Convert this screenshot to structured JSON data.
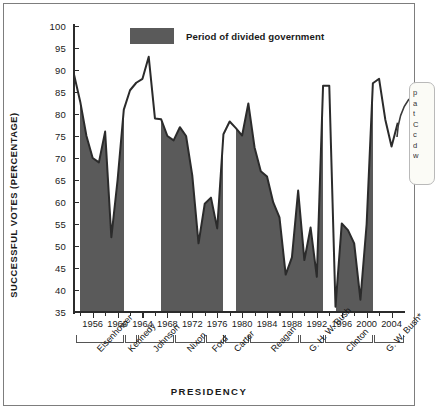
{
  "chart_data": {
    "type": "area",
    "title": "",
    "xlabel": "PRESIDENCY",
    "ylabel": "SUCCESSFUL VOTES (PERCENTAGE)",
    "ylim": [
      35,
      100
    ],
    "ytick_step": 5,
    "yticks": [
      35,
      40,
      45,
      50,
      55,
      60,
      65,
      70,
      75,
      80,
      85,
      90,
      95,
      100
    ],
    "xlim": [
      1953,
      2006
    ],
    "xticks": [
      1954,
      1956,
      1958,
      1960,
      1962,
      1964,
      1966,
      1968,
      1970,
      1972,
      1974,
      1976,
      1978,
      1980,
      1982,
      1984,
      1986,
      1988,
      1990,
      1992,
      1994,
      1996,
      1998,
      2000,
      2002,
      2004
    ],
    "xtick_labels": [
      {
        "year": 1956,
        "label": "1956"
      },
      {
        "year": 1960,
        "label": "1960"
      },
      {
        "year": 1964,
        "label": "1964"
      },
      {
        "year": 1968,
        "label": "1968"
      },
      {
        "year": 1972,
        "label": "1972"
      },
      {
        "year": 1976,
        "label": "1976"
      },
      {
        "year": 1980,
        "label": "1980"
      },
      {
        "year": 1984,
        "label": "1984"
      },
      {
        "year": 1988,
        "label": "1988"
      },
      {
        "year": 1992,
        "label": "1992"
      },
      {
        "year": 1996,
        "label": "1996"
      },
      {
        "year": 2000,
        "label": "2000"
      },
      {
        "year": 2004,
        "label": "2004"
      }
    ],
    "grid": false,
    "legend": {
      "position": "top-center",
      "entries": [
        {
          "label": "Period of divided government",
          "color": "#5a5a5a"
        }
      ]
    },
    "series": [
      {
        "name": "Successful votes (percentage)",
        "color": "#2b2b2b",
        "x": [
          1953,
          1954,
          1955,
          1956,
          1957,
          1958,
          1959,
          1960,
          1961,
          1962,
          1963,
          1964,
          1965,
          1966,
          1967,
          1968,
          1969,
          1970,
          1971,
          1972,
          1973,
          1974,
          1975,
          1976,
          1977,
          1978,
          1979,
          1980,
          1981,
          1982,
          1983,
          1984,
          1985,
          1986,
          1987,
          1988,
          1989,
          1990,
          1991,
          1992,
          1993,
          1994,
          1995,
          1996,
          1997,
          1998,
          1999,
          2000,
          2001,
          2002,
          2003,
          2004,
          2005
        ],
        "values": [
          89.0,
          82.8,
          75.0,
          70.0,
          69.0,
          76.0,
          52.0,
          65.0,
          81.0,
          85.4,
          87.1,
          88.0,
          93.0,
          79.0,
          78.8,
          75.0,
          74.0,
          77.0,
          75.0,
          66.0,
          50.6,
          59.6,
          61.0,
          54.0,
          75.4,
          78.3,
          76.8,
          75.1,
          82.4,
          72.4,
          67.0,
          65.8,
          59.9,
          56.5,
          43.5,
          47.4,
          62.6,
          46.8,
          54.2,
          43.0,
          86.4,
          86.4,
          36.2,
          55.1,
          53.6,
          50.6,
          37.8,
          55.0,
          87.0,
          88.0,
          78.7,
          72.6,
          78.0
        ]
      }
    ],
    "shaded_bands": [
      {
        "start": 1954,
        "end": 1961,
        "label": "divided government"
      },
      {
        "start": 1967,
        "end": 1977,
        "label": "divided government"
      },
      {
        "start": 1979,
        "end": 1993,
        "label": "divided government"
      },
      {
        "start": 1995,
        "end": 2001,
        "label": "divided government"
      }
    ],
    "presidencies": [
      {
        "name": "Eisenhower",
        "start": 1953,
        "end": 1961
      },
      {
        "name": "Kennedy",
        "start": 1961,
        "end": 1963
      },
      {
        "name": "Johnson",
        "start": 1963,
        "end": 1969
      },
      {
        "name": "Nixon",
        "start": 1969,
        "end": 1974
      },
      {
        "name": "Ford",
        "start": 1974,
        "end": 1977
      },
      {
        "name": "Carter",
        "start": 1977,
        "end": 1981
      },
      {
        "name": "Reagan",
        "start": 1981,
        "end": 1989
      },
      {
        "name": "G. H. W. Bush",
        "start": 1989,
        "end": 1993
      },
      {
        "name": "Clinton",
        "start": 1993,
        "end": 2001
      },
      {
        "name": "G. W. Bush*",
        "start": 2001,
        "end": 2006
      }
    ]
  },
  "callout": {
    "lines": [
      "p",
      "a",
      "t",
      "C",
      "c",
      "d",
      "w"
    ]
  }
}
